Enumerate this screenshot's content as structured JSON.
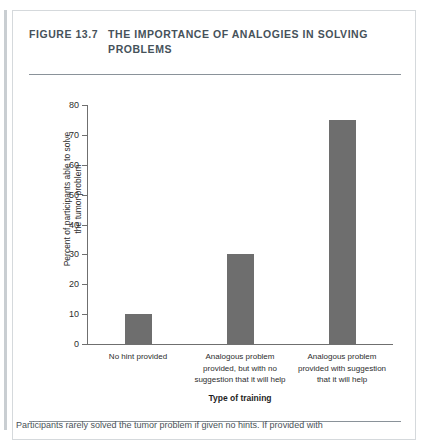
{
  "figure": {
    "number": "FIGURE 13.7",
    "title": "THE IMPORTANCE OF ANALOGIES IN SOLVING PROBLEMS",
    "caption": "Participants rarely solved the tumor problem if given no hints. If provided with"
  },
  "chart_data": {
    "type": "bar",
    "title": "THE IMPORTANCE OF ANALOGIES IN SOLVING PROBLEMS",
    "categories": [
      "No hint provided",
      "Analogous problem provided, but with no suggestion that it will help",
      "Analogous problem provided with suggestion that it will help"
    ],
    "values": [
      10,
      30,
      75
    ],
    "xlabel": "Type of training",
    "ylabel": "Percent of participants able to solve the tumor problem",
    "ylabel_line1": "Percent of participants able to solve",
    "ylabel_line2": "the tumor problem",
    "ylim": [
      0,
      80
    ],
    "yticks": [
      80,
      70,
      60,
      50,
      40,
      30,
      20,
      10,
      0
    ],
    "ytick_labels": [
      "80",
      "70",
      "60",
      "50",
      "40",
      "30",
      "20",
      "10",
      "0"
    ],
    "grid": false,
    "legend": null,
    "bar_color": "#6e6e6e",
    "axis_color": "#6f6f6f"
  }
}
